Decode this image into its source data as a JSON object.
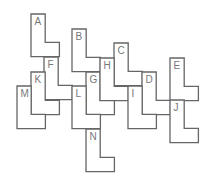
{
  "diagram": {
    "type": "L-pentomino-like tiling puzzle",
    "cell_size": 14.2,
    "stroke_color": "#666666",
    "label_color": "#777777",
    "pieces": [
      {
        "label": "A",
        "x": 31,
        "y": 14
      },
      {
        "label": "B",
        "x": 72,
        "y": 29
      },
      {
        "label": "C",
        "x": 114,
        "y": 43
      },
      {
        "label": "D",
        "x": 142,
        "y": 72
      },
      {
        "label": "E",
        "x": 170,
        "y": 58
      },
      {
        "label": "F",
        "x": 44,
        "y": 57
      },
      {
        "label": "G",
        "x": 86,
        "y": 72
      },
      {
        "label": "H",
        "x": 100,
        "y": 58
      },
      {
        "label": "I",
        "x": 128,
        "y": 86
      },
      {
        "label": "J",
        "x": 170,
        "y": 100
      },
      {
        "label": "K",
        "x": 31,
        "y": 72
      },
      {
        "label": "L",
        "x": 72,
        "y": 86
      },
      {
        "label": "M",
        "x": 17,
        "y": 86
      },
      {
        "label": "N",
        "x": 86,
        "y": 129
      }
    ]
  }
}
